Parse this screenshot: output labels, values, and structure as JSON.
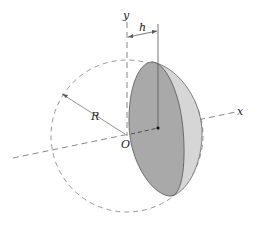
{
  "figure": {
    "labels": {
      "y_axis": "y",
      "x_axis": "x",
      "origin": "O",
      "radius": "R",
      "distance": "h"
    },
    "colors": {
      "cap_face": "#a9a9a9",
      "cap_rim": "#d6d6d6",
      "outline": "#555555",
      "dashed": "#888888",
      "background": "#ffffff"
    }
  }
}
